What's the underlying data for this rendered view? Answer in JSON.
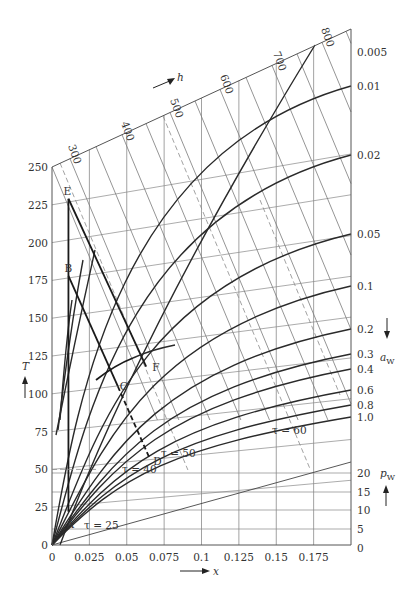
{
  "chart_data": {
    "type": "line",
    "title": "",
    "xlabel": "x",
    "ylabel": "T",
    "x_ticks": [
      0,
      0.025,
      0.05,
      0.075,
      0.1,
      0.125,
      0.15,
      0.175
    ],
    "x_tick_labels": [
      "0",
      "0.025",
      "0.05",
      "0.075",
      "0.1",
      "0.125",
      "0.15",
      "0.175"
    ],
    "xlim": [
      0,
      0.2
    ],
    "y_ticks": [
      0,
      25,
      50,
      75,
      100,
      125,
      150,
      175,
      200,
      225,
      250
    ],
    "y_tick_labels": [
      "0",
      "25",
      "50",
      "75",
      "100",
      "125",
      "150",
      "175",
      "200",
      "225",
      "250"
    ],
    "ylim": [
      0,
      250
    ],
    "h_axis": {
      "label": "h",
      "ticks": [
        "300",
        "400",
        "500",
        "600",
        "700",
        "800"
      ]
    },
    "aw_axis": {
      "label": "a",
      "subscript": "W",
      "ticks": [
        "0.005",
        "0.01",
        "0.02",
        "0.05",
        "0.1",
        "0.2",
        "0.3",
        "0.4",
        "0.6",
        "0.8",
        "1.0"
      ]
    },
    "pw_axis": {
      "label": "p",
      "subscript": "W",
      "ticks": [
        "20",
        "15",
        "10",
        "5",
        "0"
      ]
    },
    "tau_labels": [
      "τ = 25",
      "τ = 40",
      "τ = 50",
      "τ = 60"
    ],
    "points": [
      {
        "name": "A",
        "x": 0.011,
        "T": 22
      },
      {
        "name": "B",
        "x": 0.011,
        "T": 178
      },
      {
        "name": "C",
        "x": 0.044,
        "T": 105
      },
      {
        "name": "D",
        "x": 0.065,
        "T": 58
      },
      {
        "name": "E",
        "x": 0.011,
        "T": 229
      },
      {
        "name": "F",
        "x": 0.063,
        "T": 118
      }
    ],
    "process_paths": [
      {
        "name": "A-E",
        "from": "A",
        "to": "E",
        "style": "solid"
      },
      {
        "name": "B-C",
        "from": "B",
        "to": "C",
        "style": "solid"
      },
      {
        "name": "C-D",
        "from": "C",
        "to": "D",
        "style": "dashed"
      },
      {
        "name": "E-F",
        "from": "E",
        "to": "F",
        "style": "solid"
      }
    ],
    "grid": true,
    "legend": "none"
  }
}
